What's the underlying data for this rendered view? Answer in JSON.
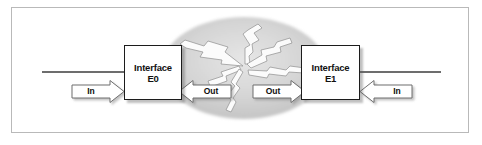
{
  "figure": {
    "frame": {
      "border_color": "#b9b9b9",
      "background": "#ffffff"
    }
  },
  "cloud": {
    "name": "network-cloud",
    "shape": "ellipse",
    "fill": "#d2d2d2",
    "bolt_fill": "#ffffff",
    "bolt_stroke": "#8a8a8a",
    "bolt_count": 6
  },
  "nodes": [
    {
      "id": "interface-e0",
      "line1": "Interface",
      "line2": "E0",
      "border_color": "#1c1c1c",
      "fill": "#ffffff"
    },
    {
      "id": "interface-e1",
      "line1": "Interface",
      "line2": "E1",
      "border_color": "#1c1c1c",
      "fill": "#ffffff"
    }
  ],
  "arrows": [
    {
      "id": "in-left",
      "label": "In",
      "direction": "right",
      "fill": "#ffffff",
      "stroke": "#6e6e6e"
    },
    {
      "id": "out-left",
      "label": "Out",
      "direction": "left",
      "fill": "#ffffff",
      "stroke": "#6e6e6e"
    },
    {
      "id": "out-right",
      "label": "Out",
      "direction": "right",
      "fill": "#ffffff",
      "stroke": "#6e6e6e"
    },
    {
      "id": "in-right",
      "label": "In",
      "direction": "left",
      "fill": "#ffffff",
      "stroke": "#6e6e6e"
    }
  ],
  "links": [
    {
      "id": "link-left",
      "color": "#3d3d3d"
    },
    {
      "id": "link-right",
      "color": "#3d3d3d"
    }
  ]
}
